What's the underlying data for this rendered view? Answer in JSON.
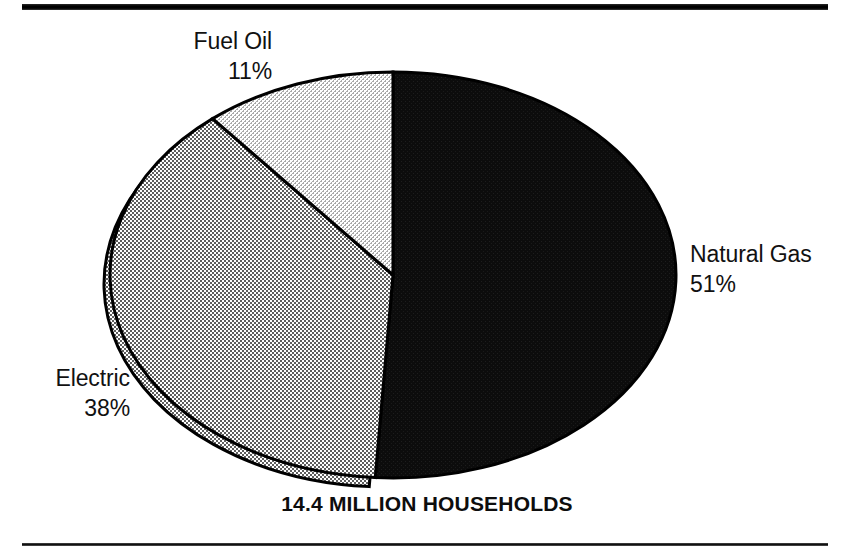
{
  "figure": {
    "caption": "14.4 MILLION HOUSEHOLDS",
    "top_rule": "horizontal-rule",
    "bottom_rule": "horizontal-rule"
  },
  "labels": {
    "fuel_oil": {
      "name": "Fuel Oil",
      "value": "11%"
    },
    "natural_gas": {
      "name": "Natural Gas",
      "value": "51%"
    },
    "electric": {
      "name": "Electric",
      "value": "38%"
    }
  },
  "chart_data": {
    "type": "pie",
    "title": "14.4 MILLION HOUSEHOLDS",
    "subtitle": "",
    "xlabel": "",
    "ylabel": "",
    "unit": "percent",
    "total_label": "14.4 MILLION HOUSEHOLDS",
    "total_value": 14.4,
    "total_unit": "million households",
    "legend_position": "outside-labels",
    "grid": false,
    "start_angle_deg": 0,
    "direction": "clockwise",
    "categories": [
      "Natural Gas",
      "Electric",
      "Fuel Oil"
    ],
    "values": [
      51,
      38,
      11
    ],
    "slices": [
      {
        "label": "Natural Gas",
        "value": 51,
        "display": "51%",
        "fill": "#111111",
        "pattern": "solid-black",
        "label_position": "right",
        "label_x": 690,
        "label_y": 239
      },
      {
        "label": "Electric",
        "value": 38,
        "display": "38%",
        "fill": "#9a9a9a",
        "pattern": "dither-50",
        "label_position": "left-bottom",
        "label_x": 30,
        "label_y": 363
      },
      {
        "label": "Fuel Oil",
        "value": 11,
        "display": "11%",
        "fill": "#c9c9c9",
        "pattern": "dither-25",
        "label_position": "top-left",
        "label_x": 150,
        "label_y": 26
      }
    ],
    "geometry": {
      "center_x": 393,
      "center_y": 275,
      "radius_x": 283,
      "radius_y": 203,
      "outline_color": "#000000",
      "outline_width": 3,
      "depth_rim": true
    }
  }
}
